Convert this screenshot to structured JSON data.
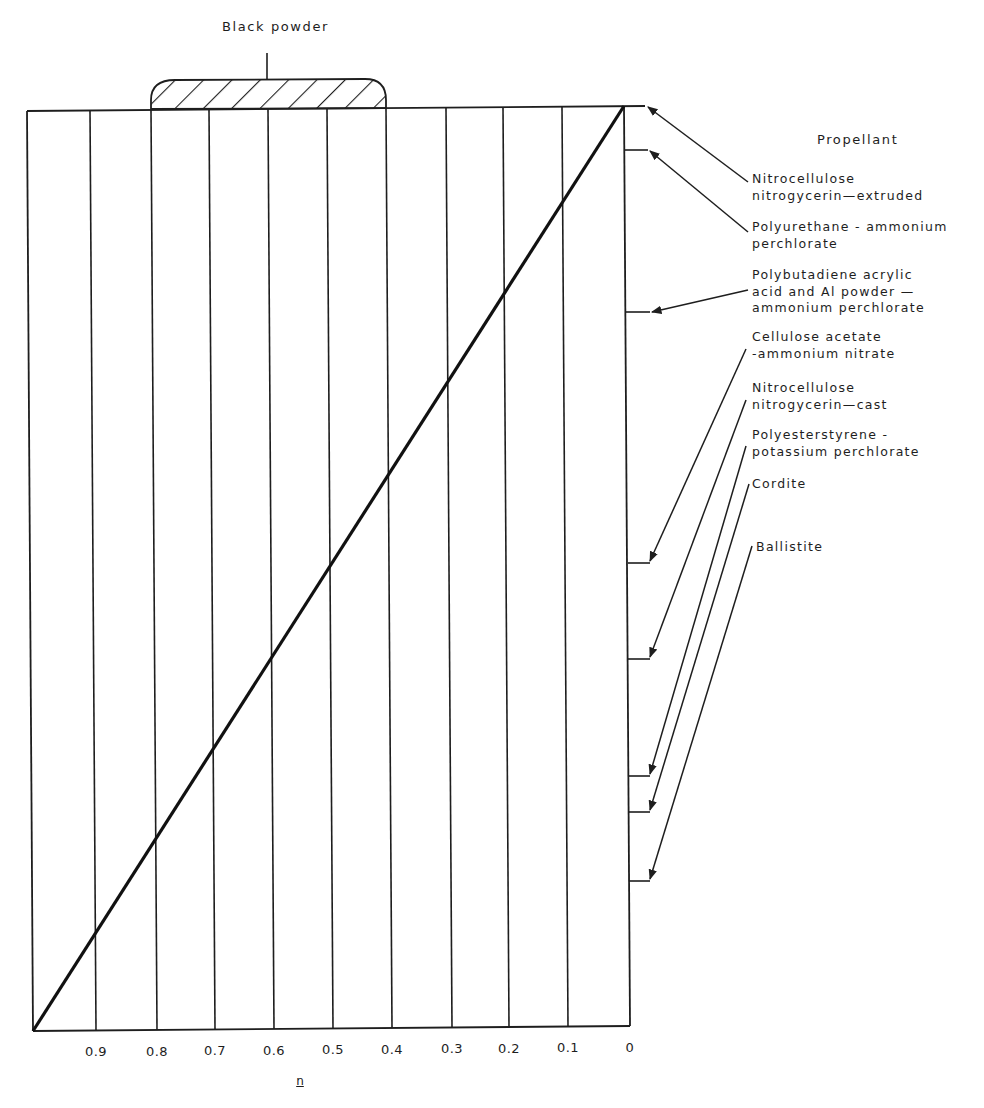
{
  "chart_data": {
    "type": "line",
    "title": "",
    "xlabel": "n",
    "ylabel": "",
    "x_reversed": true,
    "xlim": [
      1.0,
      0
    ],
    "x_ticks": [
      "0.9",
      "0.8",
      "0.7",
      "0.6",
      "0.5",
      "0.4",
      "0.3",
      "0.2",
      "0.1",
      "0"
    ],
    "grid": "vertical lines at every 0.1",
    "series": [
      {
        "name": "diagonal",
        "x": [
          1.0,
          0
        ],
        "y": [
          0,
          1
        ]
      }
    ],
    "shaded_region": {
      "label": "Black powder",
      "x_range": [
        0.8,
        0.4
      ],
      "position": "above top border",
      "fill": "hatched"
    },
    "right_axis_title": "Propellant",
    "right_axis_markers": [
      {
        "label": "Nitrocellulose nitrogycerin—extruded",
        "position_fraction_from_top": 0.0
      },
      {
        "label": "Polyurethane - ammonium perchlorate",
        "position_fraction_from_top": 0.048
      },
      {
        "label": "Polybutadiene acrylic acid and Al powder — ammonium perchlorate",
        "position_fraction_from_top": 0.224
      },
      {
        "label": "Cellulose acetate -ammonium nitrate",
        "position_fraction_from_top": 0.497
      },
      {
        "label": "Nitrocellulose nitrogycerin—cast",
        "position_fraction_from_top": 0.601
      },
      {
        "label": "Polyesterstyrene - potassium perchlorate",
        "position_fraction_from_top": 0.728
      },
      {
        "label": "Cordite",
        "position_fraction_from_top": 0.767
      },
      {
        "label": "Ballistite",
        "position_fraction_from_top": 0.842
      }
    ]
  },
  "figure": {
    "black_powder_label": "Black powder",
    "propellant_header": "Propellant",
    "x_axis_name": "n",
    "x_ticks": [
      {
        "label": "0.9",
        "x": 96
      },
      {
        "label": "0.8",
        "x": 157
      },
      {
        "label": "0.7",
        "x": 215
      },
      {
        "label": "0.6",
        "x": 274
      },
      {
        "label": "0.5",
        "x": 333
      },
      {
        "label": "0.4",
        "x": 392
      },
      {
        "label": "0.3",
        "x": 452
      },
      {
        "label": "0.2",
        "x": 509
      },
      {
        "label": "0.1",
        "x": 568
      },
      {
        "label": "0",
        "x": 630
      }
    ],
    "labels": {
      "l0a": "Nitrocellulose",
      "l0b": "nitrogycerin—extruded",
      "l1a": "Polyurethane - ammonium",
      "l1b": "perchlorate",
      "l2a": "Polybutadiene acrylic",
      "l2b": "acid and Al powder —",
      "l2c": "ammonium perchlorate",
      "l3a": "Cellulose acetate",
      "l3b": "-ammonium nitrate",
      "l4a": "Nitrocellulose",
      "l4b": "nitrogycerin—cast",
      "l5a": "Polyesterstyrene -",
      "l5b": "potassium perchlorate",
      "l6a": "Cordite",
      "l7a": "Ballistite"
    }
  }
}
